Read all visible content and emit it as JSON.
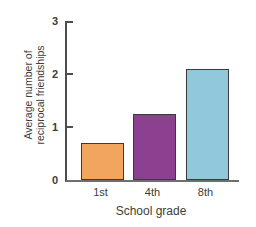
{
  "chart_data": {
    "type": "bar",
    "categories": [
      "1st",
      "4th",
      "8th"
    ],
    "values": [
      0.7,
      1.25,
      2.1
    ],
    "bar_colors": [
      "#f2a55e",
      "#8b4190",
      "#92c8dc"
    ],
    "bar_border_color": "#3a3a3a",
    "xlabel": "School grade",
    "ylabel": "Average number of reciprocal friendships",
    "ylabel_lines": [
      "Average number of",
      "reciprocal friendships"
    ],
    "ylim": [
      0,
      3
    ],
    "yticks": [
      0,
      1,
      2,
      3
    ],
    "grid": false,
    "axis_color": "#4d4d4d",
    "text_color": "#3d3d3d",
    "background_color": "#ffffff"
  }
}
